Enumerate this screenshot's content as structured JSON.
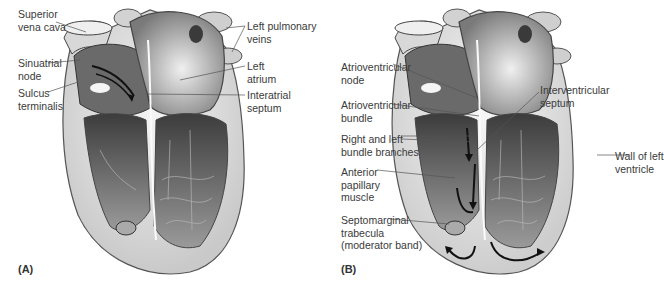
{
  "figure": {
    "panels": [
      {
        "id": "A",
        "letter": "(A)",
        "labels": [
          {
            "text": "Superior\nvena cava"
          },
          {
            "text": "Sinuatrial\nnode"
          },
          {
            "text": "Sulcus\nterminalis"
          },
          {
            "text": "Left pulmonary\nveins"
          },
          {
            "text": "Left\natrium"
          },
          {
            "text": "Interatrial\nseptum"
          }
        ]
      },
      {
        "id": "B",
        "letter": "(B)",
        "labels": [
          {
            "text": "Atrioventricular\nnode"
          },
          {
            "text": "Atrioventricular\nbundle"
          },
          {
            "text": "Right and left\nbundle branches"
          },
          {
            "text": "Anterior\npapillary\nmuscle"
          },
          {
            "text": "Septomarginal\ntrabecula\n(moderator band)"
          },
          {
            "text": "Interventricular\nseptum"
          },
          {
            "text": "Wall of left\nventricle"
          }
        ]
      }
    ],
    "colors": {
      "background": "#ffffff",
      "text": "#3a3a3a",
      "leader_line": "#555555",
      "heart_light": "#e8e8e8",
      "heart_mid": "#a8a8a8",
      "heart_dark": "#4a4a4a",
      "arrow": "#111111"
    }
  }
}
